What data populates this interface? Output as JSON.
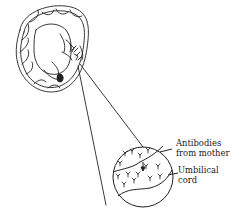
{
  "diagram": {
    "labels": [
      {
        "id": "antibodies",
        "line1": "Antibodies",
        "line2": "from mother"
      },
      {
        "id": "umbilical",
        "line1": "Umbilical",
        "line2": "cord"
      }
    ],
    "colors": {
      "stroke": "#222222",
      "background": "#ffffff"
    }
  }
}
